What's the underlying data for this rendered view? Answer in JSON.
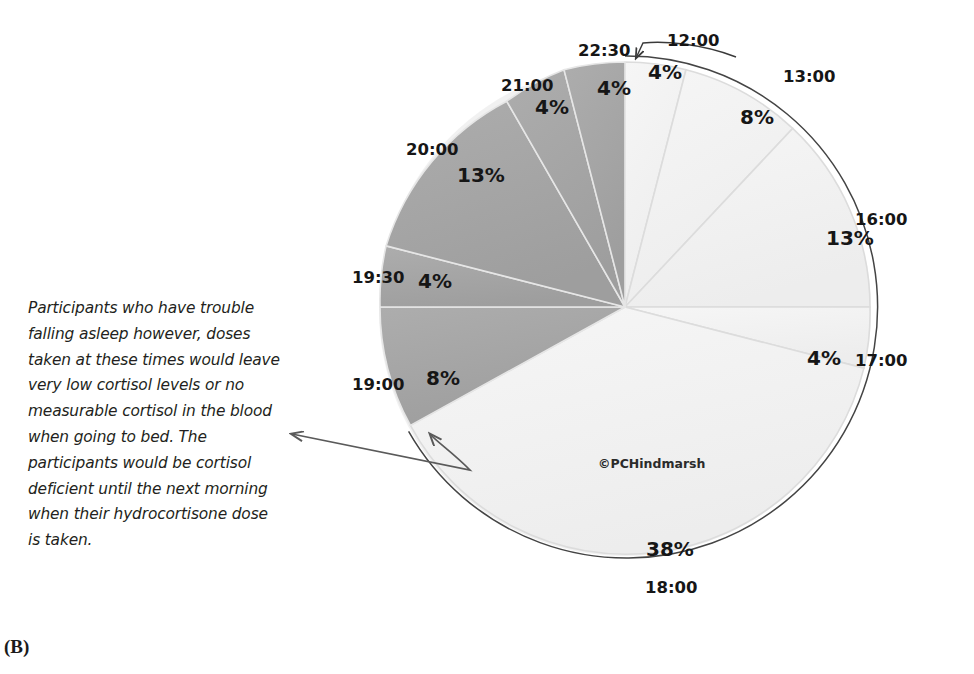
{
  "figure": {
    "panel_label": "(B)",
    "watermark": "©PCHindmarsh",
    "caption": "Participants who have trouble falling asleep however, doses taken at these times would leave very low cortisol levels or no measurable cortisol in the blood when going to bed. The participants would be cortisol deficient until the next morning when their hydrocortisone dose is taken."
  },
  "colors": {
    "light_slice": "#f2f2f2",
    "dark_slice": "#a6a6a6",
    "slice_outline": "#d9d9d9",
    "pie_border": "#3f3f3f",
    "arrow": "#5a5a5a",
    "text": "#161616"
  },
  "chart_data": {
    "type": "pie",
    "title": "",
    "legend_position": "labels-on-slices",
    "grid": false,
    "categories": [
      "12:00",
      "13:00",
      "16:00",
      "17:00",
      "18:00",
      "19:00",
      "19:30",
      "20:00",
      "21:00",
      "22:30"
    ],
    "values": [
      4,
      8,
      13,
      4,
      38,
      8,
      4,
      13,
      4,
      4
    ],
    "value_labels": [
      "4%",
      "8%",
      "13%",
      "4%",
      "38%",
      "8%",
      "4%",
      "13%",
      "4%",
      "4%"
    ],
    "slice_colors": [
      "light",
      "light",
      "light",
      "light",
      "light",
      "dark",
      "dark",
      "dark",
      "dark",
      "dark"
    ],
    "start_angle_deg": 0,
    "direction": "clockwise",
    "units": "percent"
  },
  "slices": [
    {
      "time": "12:00",
      "pct": "4%",
      "time_x": 667,
      "time_y": 33,
      "pct_x": 648,
      "pct_y": 62
    },
    {
      "time": "13:00",
      "pct": "8%",
      "time_x": 783,
      "time_y": 69,
      "pct_x": 740,
      "pct_y": 107
    },
    {
      "time": "16:00",
      "pct": "13%",
      "time_x": 855,
      "time_y": 212,
      "pct_x": 826,
      "pct_y": 228
    },
    {
      "time": "17:00",
      "pct": "4%",
      "time_x": 855,
      "time_y": 353,
      "pct_x": 807,
      "pct_y": 348
    },
    {
      "time": "18:00",
      "pct": "38%",
      "time_x": 645,
      "time_y": 580,
      "pct_x": 646,
      "pct_y": 539
    },
    {
      "time": "19:00",
      "pct": "8%",
      "time_x": 352,
      "time_y": 377,
      "pct_x": 426,
      "pct_y": 368
    },
    {
      "time": "19:30",
      "pct": "4%",
      "time_x": 352,
      "time_y": 270,
      "pct_x": 418,
      "pct_y": 271
    },
    {
      "time": "20:00",
      "pct": "13%",
      "time_x": 406,
      "time_y": 142,
      "pct_x": 457,
      "pct_y": 165
    },
    {
      "time": "21:00",
      "pct": "4%",
      "time_x": 501,
      "time_y": 78,
      "pct_x": 535,
      "pct_y": 97
    },
    {
      "time": "22:30",
      "pct": "4%",
      "time_x": 578,
      "time_y": 43,
      "pct_x": 597,
      "pct_y": 78
    }
  ]
}
